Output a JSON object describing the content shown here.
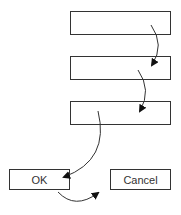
{
  "diagram": {
    "type": "tab-order",
    "fields": [
      {
        "label": ""
      },
      {
        "label": ""
      },
      {
        "label": ""
      }
    ],
    "buttons": {
      "ok": "OK",
      "cancel": "Cancel"
    },
    "colors": {
      "stroke": "#333333",
      "background": "#ffffff"
    }
  }
}
